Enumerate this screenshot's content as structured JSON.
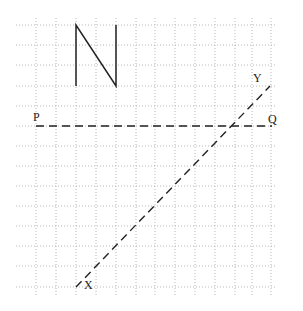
{
  "diagram": {
    "grid": {
      "x_start": 16,
      "x_end": 276,
      "y_start": 18,
      "y_end": 297,
      "vertical_lines": [
        36,
        56,
        76,
        96,
        116,
        136,
        155,
        175,
        195,
        215,
        235,
        252,
        271
      ],
      "horizontal_lines": [
        25,
        45,
        65,
        86,
        106,
        126,
        146,
        166,
        186,
        206,
        226,
        246,
        266,
        287
      ],
      "color": "#b8b8b8"
    },
    "north_arrow": {
      "label": "N",
      "points": "76,86 76,25 116,86 116,25",
      "color": "#222222"
    },
    "line_pq": {
      "x1": 36,
      "y1": 126,
      "x2": 272,
      "y2": 126,
      "start_label": "P",
      "end_label": "Q"
    },
    "line_xy": {
      "x1": 76,
      "y1": 287,
      "x2": 270,
      "y2": 86,
      "start_label": "X",
      "end_label": "Y"
    },
    "labels": {
      "P": "P",
      "Q": "Q",
      "X": "X",
      "Y": "Y"
    }
  }
}
